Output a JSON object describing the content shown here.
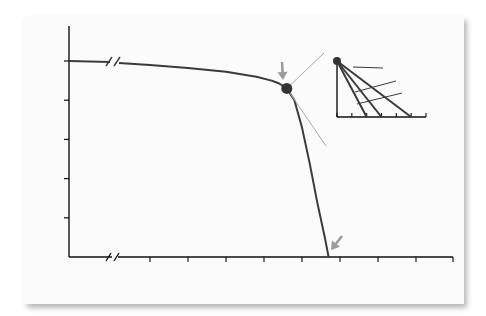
{
  "chart_data": {
    "type": "line",
    "title": "",
    "xlabel": "Age (yr)",
    "ylabel": "% survival",
    "xlim": [
      30,
      80
    ],
    "ylim": [
      0,
      118
    ],
    "x_ticks": [
      40,
      50,
      60,
      70,
      80
    ],
    "x_minor_ticks": [
      45,
      55,
      65,
      75
    ],
    "y_ticks": [
      20,
      40,
      60,
      80,
      100
    ],
    "axis_breaks": true,
    "grid": false,
    "series": [
      {
        "name": "Survival",
        "points": [
          [
            30,
            100
          ],
          [
            35,
            99
          ],
          [
            40,
            98
          ],
          [
            45,
            96.5
          ],
          [
            50,
            94.5
          ],
          [
            54,
            92
          ],
          [
            56,
            90
          ],
          [
            57,
            88.5
          ],
          [
            58,
            86
          ],
          [
            59,
            80
          ],
          [
            60,
            66
          ],
          [
            61,
            48
          ],
          [
            62,
            28
          ],
          [
            63,
            10
          ],
          [
            63.5,
            0
          ]
        ]
      }
    ],
    "marker": {
      "label": "Onset severe symptoms",
      "x": 58,
      "y": 86
    },
    "annotations": [
      {
        "id": "latent",
        "lines": [
          "Latent period",
          "(increasing obstruction,",
          "myocardial overload)"
        ]
      },
      {
        "id": "onset",
        "lines": [
          "Onset severe",
          "symptoms"
        ]
      },
      {
        "id": "death",
        "lines": [
          "Average death",
          "age"
        ],
        "x": 63.5
      }
    ],
    "inset": {
      "type": "line",
      "xlabel": "Av survival (yr)",
      "xlim": [
        0,
        6
      ],
      "x_ticks": [
        0,
        2,
        4,
        6
      ],
      "x_minor_ticks": [
        1,
        3,
        5
      ],
      "series": [
        {
          "name": "Angina",
          "survival_years": 5
        },
        {
          "name": "Syncope",
          "survival_years": 3
        },
        {
          "name": "Failure",
          "survival_years": 2
        }
      ]
    },
    "colors": {
      "curve": "#3a3a3a",
      "marker": "#333333",
      "arrow": "#9a9a9a",
      "zoom_lines": "#a8a8a8",
      "axis": "#111111"
    }
  }
}
